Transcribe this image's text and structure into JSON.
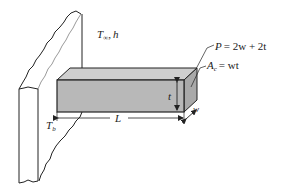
{
  "diagram": {
    "labels": {
      "ambient": "T",
      "ambient_sub": "∞",
      "ambient_sep": ",",
      "ambient_h": "h",
      "perimeter_lhs": "P",
      "perimeter_rhs": "= 2w + 2t",
      "area_lhs": "A",
      "area_sub": "c",
      "area_rhs": "= wt",
      "thickness": "t",
      "length": "L",
      "width": "w",
      "base_temp": "T",
      "base_temp_sub": "b"
    },
    "colors": {
      "fin_front": "#b8b8b8",
      "fin_top": "#cfcfcf",
      "fin_end": "#a9a9a9",
      "line": "#222222"
    }
  }
}
